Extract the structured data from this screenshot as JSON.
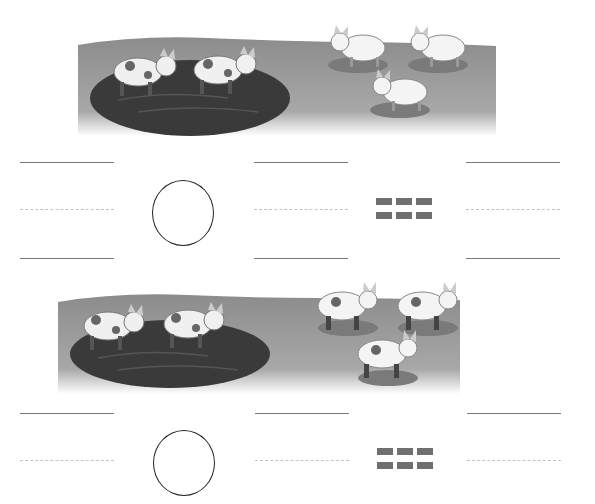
{
  "worksheet": {
    "problems": [
      {
        "scene": {
          "description": "pigs-in-mud",
          "pigs_in_mud": 2,
          "pigs_on_grass": 3,
          "pig_style": "spotted-in-mud, plain-on-grass"
        },
        "equation": {
          "blank_1": "",
          "operator_circle": "",
          "blank_2": "",
          "equals_sign": "=",
          "answer_blank": ""
        }
      },
      {
        "scene": {
          "description": "pigs-in-mud",
          "pigs_in_mud": 2,
          "pigs_on_grass": 3,
          "pig_style": "all-spotted"
        },
        "equation": {
          "blank_1": "",
          "operator_circle": "",
          "blank_2": "",
          "equals_sign": "=",
          "answer_blank": ""
        }
      }
    ],
    "colors": {
      "ground": "#8f8f8f",
      "mud": "#3a3a3a",
      "pig": "#f2f2f2",
      "line_solid": "#7a7a7a",
      "line_dashed": "#c4c4c4",
      "equals": "#6f6f6f"
    }
  }
}
